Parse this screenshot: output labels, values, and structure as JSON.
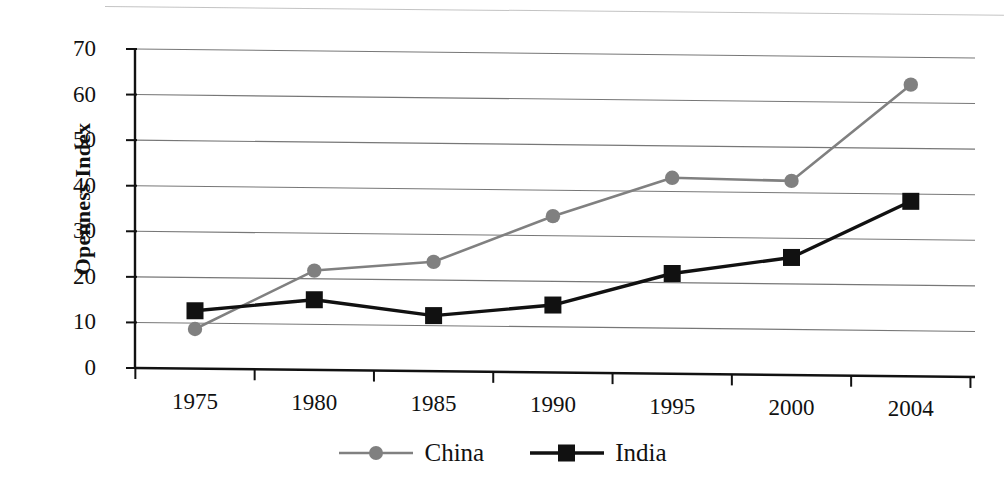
{
  "chart_data": {
    "type": "line",
    "title": "",
    "subtitle": "",
    "xlabel": "",
    "ylabel": "Openness Index",
    "categories": [
      "1975",
      "1980",
      "1985",
      "1990",
      "1995",
      "2000",
      "2004"
    ],
    "ylim": [
      0,
      70
    ],
    "y_ticks": [
      0,
      10,
      20,
      30,
      40,
      50,
      60,
      70
    ],
    "y_tick_labels": [
      "0",
      "10",
      "20",
      "30",
      "40",
      "50",
      "60",
      "70"
    ],
    "grid": "horizontal",
    "legend_position": "bottom-center",
    "series": [
      {
        "name": "China",
        "color": "#808080",
        "marker": "circle",
        "values": [
          8.7,
          21.8,
          24.0,
          34.3,
          43.0,
          42.6,
          64.0
        ]
      },
      {
        "name": "India",
        "color": "#111111",
        "marker": "square",
        "values": [
          12.7,
          15.4,
          12.2,
          14.8,
          22.0,
          25.8,
          38.4
        ]
      }
    ]
  },
  "axes": {
    "y_title": "Openness Index"
  },
  "legend": {
    "entries": [
      {
        "label": "China",
        "marker": "circle-marker",
        "color": "#808080"
      },
      {
        "label": "India",
        "marker": "square-marker",
        "color": "#111111"
      }
    ]
  }
}
